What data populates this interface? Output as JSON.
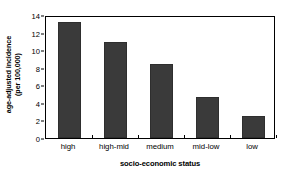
{
  "chart_data": {
    "type": "bar",
    "title": "",
    "categories": [
      "high",
      "high-mid",
      "medium",
      "mid-low",
      "low"
    ],
    "values": [
      13.2,
      10.9,
      8.4,
      4.7,
      2.5
    ],
    "xlabel": "socio-economic status",
    "ylabel_line1": "age-adjusted incidence",
    "ylabel_line2": "(per 100,000)",
    "ylim": [
      0,
      14
    ],
    "ytick_labels": [
      "0",
      "2",
      "4",
      "6",
      "8",
      "10",
      "12",
      "14"
    ],
    "ytick_values": [
      0,
      2,
      4,
      6,
      8,
      10,
      12,
      14
    ],
    "grid": false,
    "legend": false,
    "bar_color": "#3a3a3a",
    "frame_color": "#000000",
    "background_color": "#ffffff"
  }
}
